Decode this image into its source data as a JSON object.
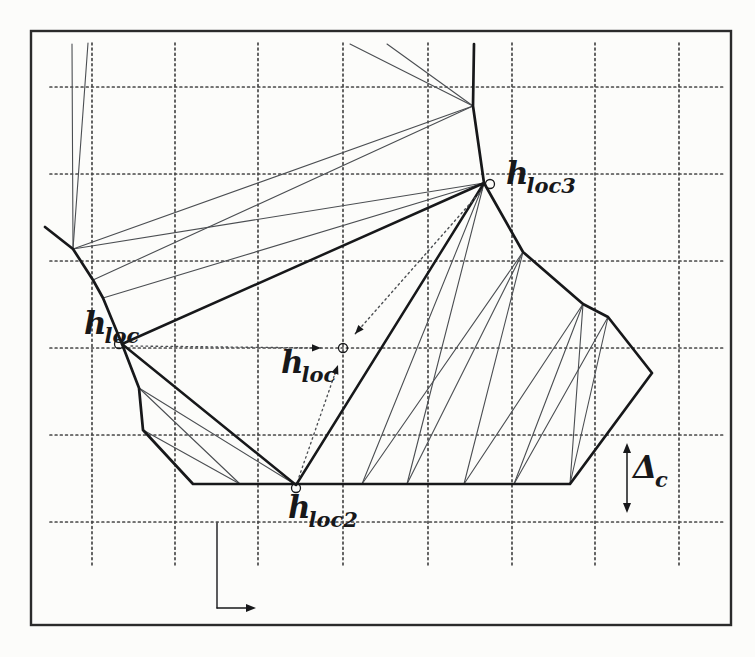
{
  "figure": {
    "kind": "scanned-mesh-diagram",
    "description_visible_text_only": true
  },
  "colors": {
    "ink": "#17181a",
    "thin_line": "#4b4e52",
    "grid_dot": "#474747",
    "frame": "#2b2b2b",
    "background": "#fcfcfa"
  },
  "labels": {
    "h_loc_left": {
      "base": "h",
      "sub": "loc",
      "x": 84,
      "y": 308
    },
    "h_loc3": {
      "base": "h",
      "sub": "loc3",
      "x": 506,
      "y": 158
    },
    "h_loc_center": {
      "base": "h",
      "sub": "loc",
      "x": 281,
      "y": 347
    },
    "h_loc2": {
      "base": "h",
      "sub": "loc2",
      "x": 288,
      "y": 492
    },
    "delta_c": {
      "base": "Δ",
      "sub": "c",
      "x": 633,
      "y": 452
    }
  },
  "geometry": {
    "frame": {
      "x": 31,
      "y": 31,
      "w": 700,
      "h": 594
    },
    "grid": {
      "vertical_x": [
        92,
        175,
        258,
        343,
        428,
        512,
        595,
        679
      ],
      "v_y1": 43,
      "v_y2": 566,
      "horizontal_y": [
        87,
        174,
        261,
        348,
        435,
        522
      ],
      "h_x1": 50,
      "h_x2": 724
    },
    "coarse_boundary": [
      [
        474,
        44
      ],
      [
        473,
        106
      ],
      [
        479,
        148
      ],
      [
        484,
        183
      ],
      [
        523,
        252
      ],
      [
        583,
        304
      ],
      [
        608,
        317
      ],
      [
        652,
        373
      ],
      [
        570,
        484
      ],
      [
        193,
        484
      ],
      [
        143,
        430
      ],
      [
        139,
        388
      ],
      [
        122,
        344
      ],
      [
        103,
        298
      ],
      [
        93,
        280
      ],
      [
        73,
        249
      ],
      [
        45,
        227
      ]
    ],
    "coarse_triangle": [
      [
        122,
        344
      ],
      [
        484,
        183
      ],
      [
        296,
        485
      ]
    ],
    "fine_lines": [
      [
        [
          72,
          44
        ],
        [
          73,
          249
        ]
      ],
      [
        [
          88,
          43
        ],
        [
          73,
          249
        ]
      ],
      [
        [
          350,
          44
        ],
        [
          473,
          106
        ]
      ],
      [
        [
          387,
          44
        ],
        [
          473,
          106
        ]
      ],
      [
        [
          73,
          249
        ],
        [
          473,
          106
        ]
      ],
      [
        [
          93,
          280
        ],
        [
          473,
          106
        ]
      ],
      [
        [
          73,
          249
        ],
        [
          484,
          183
        ]
      ],
      [
        [
          103,
          298
        ],
        [
          484,
          183
        ]
      ],
      [
        [
          139,
          388
        ],
        [
          240,
          484
        ]
      ],
      [
        [
          139,
          388
        ],
        [
          296,
          485
        ]
      ],
      [
        [
          143,
          430
        ],
        [
          240,
          484
        ]
      ],
      [
        [
          362,
          484
        ],
        [
          484,
          183
        ]
      ],
      [
        [
          362,
          484
        ],
        [
          523,
          252
        ]
      ],
      [
        [
          407,
          484
        ],
        [
          523,
          252
        ]
      ],
      [
        [
          407,
          484
        ],
        [
          484,
          183
        ]
      ],
      [
        [
          464,
          484
        ],
        [
          523,
          252
        ]
      ],
      [
        [
          464,
          484
        ],
        [
          583,
          304
        ]
      ],
      [
        [
          514,
          484
        ],
        [
          583,
          304
        ]
      ],
      [
        [
          514,
          484
        ],
        [
          608,
          317
        ]
      ],
      [
        [
          570,
          484
        ],
        [
          583,
          304
        ]
      ],
      [
        [
          570,
          484
        ],
        [
          608,
          317
        ]
      ]
    ],
    "dashed_center_arrows": [
      {
        "from": [
          131,
          346
        ],
        "to": [
          321,
          348
        ]
      },
      {
        "from": [
          482,
          190
        ],
        "to": [
          355,
          334
        ]
      },
      {
        "from": [
          299,
          477
        ],
        "to": [
          338,
          365
        ]
      }
    ],
    "vertex_circles": [
      [
        119,
        344
      ],
      [
        490,
        184
      ],
      [
        296,
        488
      ],
      [
        343,
        348
      ]
    ],
    "circle_radius": 4.5,
    "axis_marker": {
      "top": [
        217,
        523
      ],
      "corner": [
        217,
        608
      ],
      "arrow_tip": [
        256,
        608
      ]
    },
    "delta_arrow": {
      "x": 627,
      "y1": 443,
      "y2": 513
    }
  }
}
